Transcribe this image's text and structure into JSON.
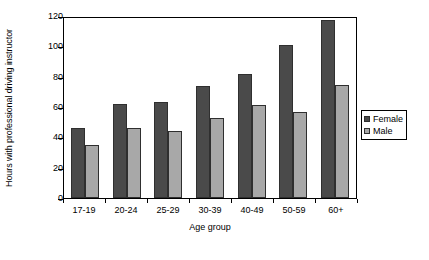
{
  "chart_data": {
    "type": "bar",
    "title": "",
    "xlabel": "Age group",
    "ylabel": "Hours with professional driving instructor",
    "categories": [
      "17-19",
      "20-24",
      "25-29",
      "30-39",
      "40-49",
      "50-59",
      "60+"
    ],
    "series": [
      {
        "name": "Female",
        "color": "#4a4a4a",
        "values": [
          46,
          62,
          63,
          74,
          82,
          101,
          117.5
        ]
      },
      {
        "name": "Male",
        "color": "#a8a8a8",
        "values": [
          35,
          46,
          44.5,
          53,
          61,
          57,
          74.5
        ]
      }
    ],
    "ylim": [
      0,
      120
    ],
    "yticks": [
      0,
      20,
      40,
      60,
      80,
      100,
      120
    ],
    "ytick_labels": [
      "0",
      "20",
      "40",
      "60",
      "80",
      "100",
      "120"
    ],
    "grid": false,
    "legend_position": "right"
  }
}
